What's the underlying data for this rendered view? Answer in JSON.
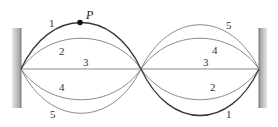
{
  "figure": {
    "point_label": "P",
    "curves": [
      {
        "id": "1",
        "label_left": "1",
        "label_right": "1",
        "amplitude": 1.0,
        "color": "#3a3a3a"
      },
      {
        "id": "2",
        "label_left": "2",
        "label_right": "2",
        "amplitude": 0.6,
        "color": "#8a8a8a"
      },
      {
        "id": "3",
        "label_left": "3",
        "label_right": "3",
        "amplitude": 0.0,
        "color": "#8a8a8a"
      },
      {
        "id": "4",
        "label_left": "4",
        "label_right": "4",
        "amplitude": -0.6,
        "color": "#8a8a8a"
      },
      {
        "id": "5",
        "label_left": "5",
        "label_right": "5",
        "amplitude": -1.0,
        "color": "#8a8a8a"
      }
    ],
    "walls": {
      "left": "left-wall",
      "right": "right-wall",
      "color": "#b0b0b0"
    }
  }
}
